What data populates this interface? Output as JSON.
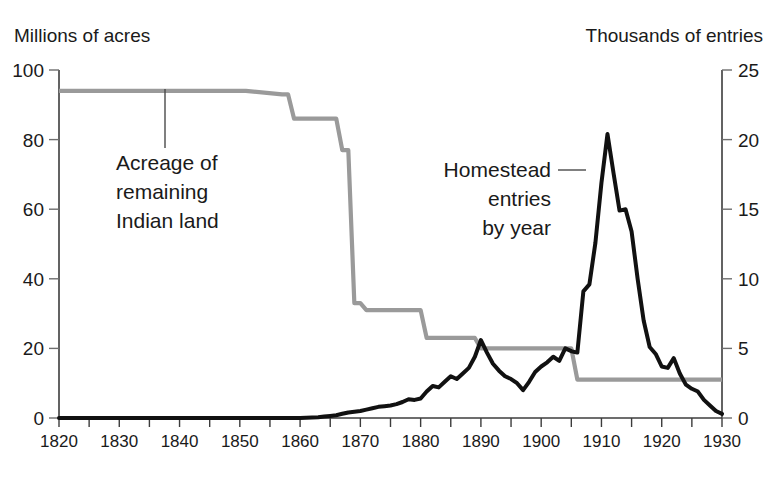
{
  "chart_data": {
    "type": "line",
    "title": "",
    "subtitle": "",
    "grid": false,
    "legend_position": "inline-annotations",
    "xlabel": "",
    "xlim": [
      1820,
      1930
    ],
    "x_ticks_major": [
      1820,
      1830,
      1840,
      1850,
      1860,
      1870,
      1880,
      1890,
      1900,
      1910,
      1920,
      1930
    ],
    "x_ticks_minor_step": 5,
    "axes": [
      {
        "id": "left",
        "label": "Millions of acres",
        "ylim": [
          0,
          100
        ],
        "ticks": [
          0,
          20,
          40,
          60,
          80,
          100
        ],
        "tick_labels": [
          "0",
          "20",
          "40",
          "60",
          "80",
          "100"
        ]
      },
      {
        "id": "right",
        "label": "Thousands of entries",
        "ylim": [
          0,
          25
        ],
        "ticks": [
          0,
          5,
          10,
          15,
          20,
          25
        ],
        "tick_labels": [
          "0",
          "5",
          "10",
          "15",
          "20",
          "25"
        ]
      }
    ],
    "series": [
      {
        "name": "Acreage of remaining Indian land",
        "axis": "left",
        "units": "millions of acres",
        "color": "#9a9a9a",
        "style": "step",
        "annotation": {
          "lines": [
            "Acreage of",
            "remaining",
            "Indian land"
          ],
          "align": "left",
          "leader": "vertical"
        },
        "x": [
          1820,
          1850,
          1851,
          1857,
          1858,
          1859,
          1860,
          1866,
          1867,
          1868,
          1869,
          1870,
          1871,
          1874,
          1875,
          1880,
          1881,
          1889,
          1890,
          1904,
          1905,
          1906,
          1907,
          1930
        ],
        "values": [
          94,
          94,
          94,
          93,
          93,
          86,
          86,
          86,
          77,
          77,
          33,
          33,
          31,
          31,
          31,
          31,
          23,
          23,
          20,
          20,
          20,
          11,
          11,
          11
        ]
      },
      {
        "name": "Homestead entries by year",
        "axis": "right",
        "units": "thousands of entries",
        "color": "#111111",
        "style": "line",
        "annotation": {
          "lines": [
            "Homestead",
            "entries",
            "by year"
          ],
          "align": "right",
          "leader": "horizontal"
        },
        "x": [
          1820,
          1830,
          1840,
          1850,
          1860,
          1863,
          1864,
          1865,
          1866,
          1867,
          1868,
          1869,
          1870,
          1871,
          1872,
          1873,
          1874,
          1875,
          1876,
          1877,
          1878,
          1879,
          1880,
          1881,
          1882,
          1883,
          1884,
          1885,
          1886,
          1887,
          1888,
          1889,
          1890,
          1891,
          1892,
          1893,
          1894,
          1895,
          1896,
          1897,
          1898,
          1899,
          1900,
          1901,
          1902,
          1903,
          1904,
          1905,
          1906,
          1907,
          1908,
          1909,
          1910,
          1911,
          1912,
          1913,
          1914,
          1915,
          1916,
          1917,
          1918,
          1919,
          1920,
          1921,
          1922,
          1923,
          1924,
          1925,
          1926,
          1927,
          1928,
          1929,
          1930
        ],
        "values": [
          0,
          0,
          0,
          0,
          0,
          0.05,
          0.1,
          0.15,
          0.2,
          0.3,
          0.4,
          0.45,
          0.5,
          0.6,
          0.7,
          0.8,
          0.85,
          0.9,
          1.0,
          1.15,
          1.35,
          1.3,
          1.4,
          1.9,
          2.3,
          2.2,
          2.6,
          3.0,
          2.8,
          3.2,
          3.6,
          4.4,
          5.6,
          4.7,
          3.9,
          3.4,
          3.0,
          2.8,
          2.5,
          2.0,
          2.6,
          3.3,
          3.7,
          4.0,
          4.4,
          4.1,
          5.0,
          4.8,
          4.7,
          9.1,
          9.6,
          12.6,
          16.9,
          20.4,
          17.6,
          14.9,
          15.0,
          13.4,
          10.0,
          7.0,
          5.1,
          4.6,
          3.7,
          3.6,
          4.3,
          3.2,
          2.4,
          2.1,
          1.9,
          1.3,
          0.9,
          0.5,
          0.3
        ]
      }
    ]
  },
  "axis_titles": {
    "left": "Millions of acres",
    "right": "Thousands of entries"
  },
  "annotations": {
    "indian_land": {
      "line1": "Acreage of",
      "line2": "remaining",
      "line3": "Indian land"
    },
    "homestead": {
      "line1": "Homestead",
      "line2": "entries",
      "line3": "by year"
    }
  },
  "colors": {
    "indian_land_line": "#9a9a9a",
    "homestead_line": "#111111",
    "axis": "#3c3c3c",
    "text": "#1a1a1a",
    "background": "#ffffff"
  }
}
